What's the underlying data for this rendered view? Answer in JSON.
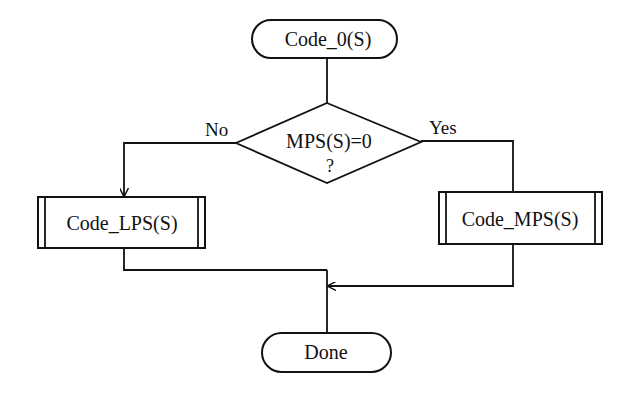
{
  "diagram": {
    "type": "flowchart",
    "colors": {
      "stroke": "#111111",
      "background": "#ffffff",
      "text": "#111111"
    },
    "nodes": {
      "start": {
        "shape": "terminal",
        "label": "Code_0(S)"
      },
      "decision": {
        "shape": "diamond",
        "line1": "MPS(S)=0",
        "line2": "?"
      },
      "lps": {
        "shape": "predefined-process",
        "label": "Code_LPS(S)"
      },
      "mps": {
        "shape": "predefined-process",
        "label": "Code_MPS(S)"
      },
      "done": {
        "shape": "terminal",
        "label": "Done"
      }
    },
    "edges": {
      "no_label": "No",
      "yes_label": "Yes"
    }
  }
}
